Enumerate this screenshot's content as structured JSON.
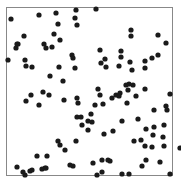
{
  "chart_data": {
    "type": "scatter",
    "title": "",
    "xlabel": "",
    "ylabel": "",
    "grid": false,
    "legend": null,
    "frame": {
      "left": 6,
      "top": 7,
      "right": 172,
      "bottom": 175,
      "color": "#888888"
    },
    "marker": {
      "color": "#1a1a1a",
      "radius": 2.6
    },
    "xlim": [
      0,
      1
    ],
    "ylim": [
      0,
      1
    ],
    "points_px": [
      [
        11,
        19
      ],
      [
        39,
        15
      ],
      [
        56,
        13
      ],
      [
        58,
        24
      ],
      [
        76,
        10
      ],
      [
        75,
        18
      ],
      [
        77,
        25
      ],
      [
        24,
        36
      ],
      [
        54,
        34
      ],
      [
        60,
        40
      ],
      [
        17,
        44
      ],
      [
        16,
        48
      ],
      [
        18,
        44
      ],
      [
        44,
        44
      ],
      [
        46,
        48
      ],
      [
        52,
        47
      ],
      [
        8,
        60
      ],
      [
        25,
        60
      ],
      [
        26,
        66
      ],
      [
        32,
        67
      ],
      [
        59,
        67
      ],
      [
        50,
        76
      ],
      [
        63,
        81
      ],
      [
        72,
        55
      ],
      [
        73,
        58
      ],
      [
        75,
        68
      ],
      [
        31,
        95
      ],
      [
        26,
        101
      ],
      [
        64,
        100
      ],
      [
        77,
        98
      ],
      [
        78,
        103
      ],
      [
        77,
        117
      ],
      [
        82,
        125
      ],
      [
        96,
        9
      ],
      [
        100,
        50
      ],
      [
        101,
        63
      ],
      [
        105,
        59
      ],
      [
        106,
        67
      ],
      [
        121,
        51
      ],
      [
        131,
        36
      ],
      [
        131,
        30
      ],
      [
        121,
        57
      ],
      [
        130,
        62
      ],
      [
        119,
        66
      ],
      [
        132,
        70
      ],
      [
        158,
        35
      ],
      [
        166,
        43
      ],
      [
        158,
        55
      ],
      [
        145,
        61
      ],
      [
        145,
        68
      ],
      [
        152,
        58
      ],
      [
        129,
        84
      ],
      [
        126,
        85
      ],
      [
        128,
        90
      ],
      [
        133,
        85
      ],
      [
        100,
        95
      ],
      [
        98,
        89
      ],
      [
        103,
        104
      ],
      [
        95,
        105
      ],
      [
        112,
        98
      ],
      [
        116,
        95
      ],
      [
        119,
        96
      ],
      [
        120,
        93
      ],
      [
        127,
        103
      ],
      [
        136,
        96
      ],
      [
        145,
        89
      ],
      [
        170,
        94
      ],
      [
        166,
        106
      ],
      [
        167,
        110
      ],
      [
        154,
        110
      ],
      [
        154,
        127
      ],
      [
        141,
        140
      ],
      [
        145,
        146
      ],
      [
        152,
        147
      ],
      [
        164,
        146
      ],
      [
        180,
        148
      ],
      [
        134,
        141
      ],
      [
        113,
        131
      ],
      [
        122,
        121
      ],
      [
        104,
        134
      ],
      [
        146,
        160
      ],
      [
        160,
        162
      ],
      [
        142,
        166
      ],
      [
        170,
        174
      ],
      [
        129,
        174
      ],
      [
        122,
        174
      ],
      [
        102,
        172
      ],
      [
        97,
        175
      ],
      [
        110,
        161
      ],
      [
        93,
        163
      ],
      [
        138,
        119
      ],
      [
        146,
        129
      ],
      [
        153,
        135
      ],
      [
        163,
        137
      ],
      [
        164,
        125
      ],
      [
        102,
        160
      ],
      [
        76,
        141
      ],
      [
        73,
        166
      ],
      [
        45,
        168
      ],
      [
        37,
        156
      ],
      [
        47,
        156
      ],
      [
        42,
        169
      ],
      [
        46,
        168
      ],
      [
        30,
        171
      ],
      [
        25,
        175
      ],
      [
        23,
        172
      ],
      [
        32,
        170
      ],
      [
        17,
        167
      ],
      [
        39,
        105
      ],
      [
        49,
        95
      ],
      [
        43,
        92
      ],
      [
        91,
        114
      ],
      [
        88,
        130
      ],
      [
        81,
        117
      ],
      [
        88,
        121
      ],
      [
        92,
        122
      ],
      [
        108,
        160
      ],
      [
        58,
        141
      ],
      [
        60,
        145
      ],
      [
        65,
        150
      ],
      [
        70,
        165
      ]
    ]
  }
}
